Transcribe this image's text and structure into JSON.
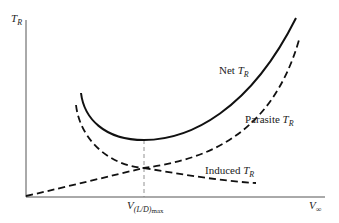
{
  "diagram": {
    "axes": {
      "y_label": {
        "main": "T",
        "sub": "R"
      },
      "x_label": {
        "main": "V",
        "sub": "∞"
      }
    },
    "curves": [
      {
        "name": "Net",
        "label_text": "Net ",
        "symbol": "T",
        "sub": "R",
        "style": "solid"
      },
      {
        "name": "Parasite",
        "label_text": "Parasite ",
        "symbol": "T",
        "sub": "R",
        "style": "dashed"
      },
      {
        "name": "Induced",
        "label_text": "Induced ",
        "symbol": "T",
        "sub": "R",
        "style": "dashed"
      }
    ],
    "marker": {
      "main": "V",
      "sub": "(L/D)",
      "subsub": "max",
      "style": "dashed vertical"
    },
    "colors": {
      "line": "#111111",
      "background": "#ffffff"
    }
  }
}
